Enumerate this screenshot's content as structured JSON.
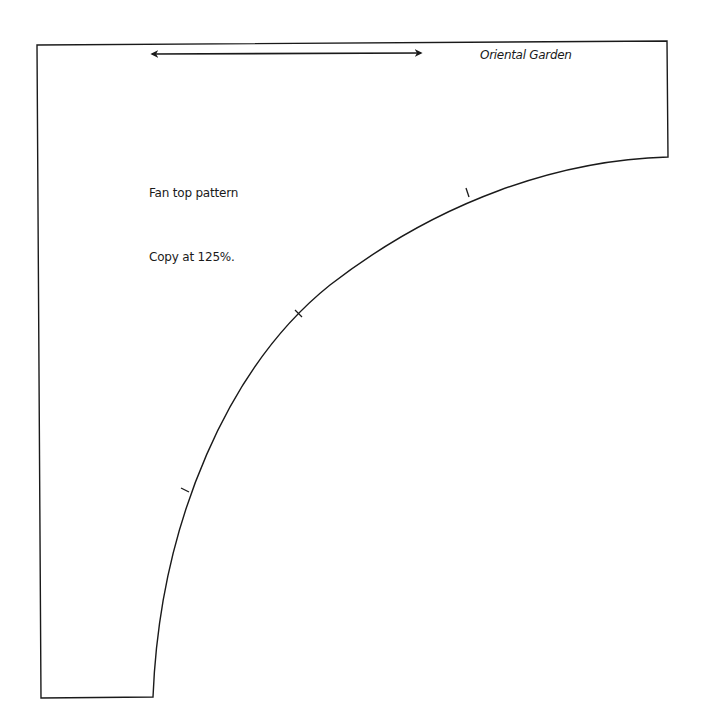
{
  "pattern": {
    "title": "Oriental Garden",
    "name": "Fan top pattern",
    "instruction": "Copy at 125%."
  },
  "shapes": {
    "grain_line_arrow": "double-headed-arrow",
    "notch_marks": 3
  },
  "colors": {
    "line": "#1a1a1a",
    "background": "#ffffff"
  }
}
